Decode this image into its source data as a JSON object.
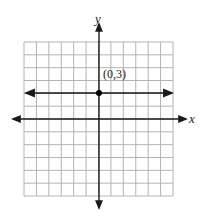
{
  "chart_data": {
    "type": "line",
    "title": "",
    "xlabel": "x",
    "ylabel": "y",
    "grid": true,
    "grid_cols": 12,
    "grid_rows": 12,
    "xlim": [
      -6,
      6
    ],
    "ylim": [
      -6,
      6
    ],
    "series": [
      {
        "name": "horizontal line y = 3",
        "equation": "y = 3",
        "x": [
          -6,
          6
        ],
        "y": [
          3,
          3
        ]
      }
    ],
    "points": [
      {
        "x": 0,
        "y": 3,
        "label": "(0,3)"
      }
    ],
    "annotations": [
      "(0,3)"
    ]
  },
  "labels": {
    "x_axis": "x",
    "y_axis": "y",
    "point": "(0,3)"
  },
  "colors": {
    "grid": "#b4b4b4",
    "axis": "#1a1a1a",
    "line": "#1a1a1a",
    "point": "#000000"
  }
}
